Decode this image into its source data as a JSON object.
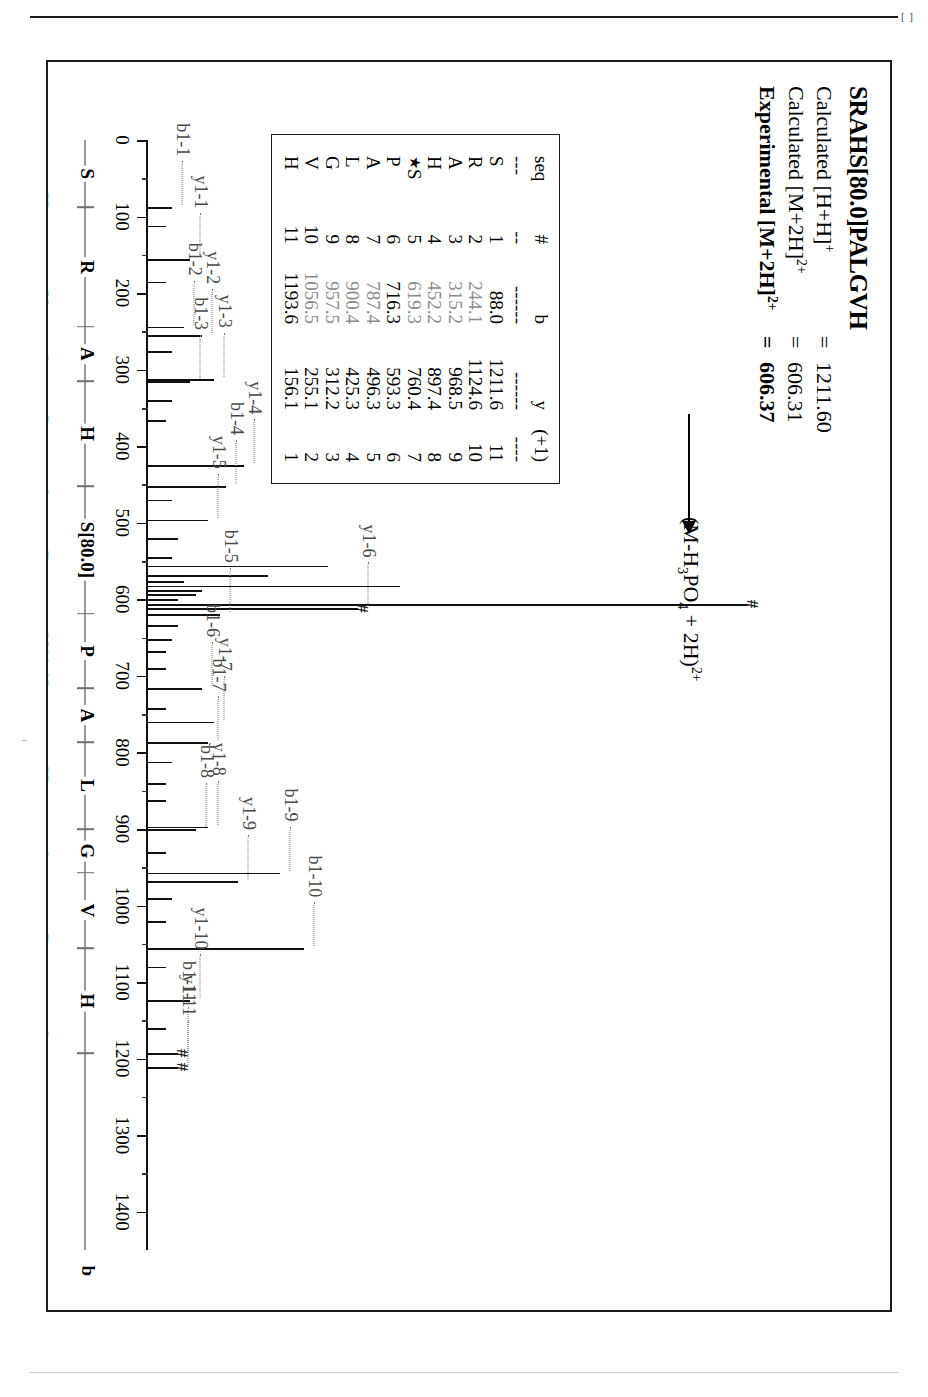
{
  "page": {
    "corner_mark": "[ ]"
  },
  "header": {
    "sequence_title": "SRAHS[80.0]PALGVH",
    "rows": [
      {
        "label_pre": "Calculated [H+H]",
        "label_sup": "+",
        "eq": "=",
        "value": "1211.60",
        "bold": false
      },
      {
        "label_pre": "Calculated [M+2H]",
        "label_sup": "2+",
        "eq": "=",
        "value": "606.31",
        "bold": false
      },
      {
        "label_pre": "Experimental [M+2H]",
        "label_sup": "2+",
        "eq": "=",
        "value": "606.37",
        "bold": true
      }
    ]
  },
  "annotation": {
    "neutral_loss_label_pre": "(M-H",
    "neutral_loss_sub1": "3",
    "neutral_loss_mid": "PO",
    "neutral_loss_sub2": "4",
    "neutral_loss_post": " + 2H)",
    "neutral_loss_sup": "2+"
  },
  "ion_table": {
    "columns": [
      "seq",
      "#",
      "b",
      "y",
      "(+1)"
    ],
    "dash": [
      "---",
      "--",
      "------",
      "------",
      "----"
    ],
    "rows": [
      {
        "seq": "S",
        "star": false,
        "num": "1",
        "b": "88.0",
        "y": "1211.6",
        "p": "11",
        "b_faint": false,
        "y_faint": false
      },
      {
        "seq": "R",
        "star": false,
        "num": "2",
        "b": "244.1",
        "y": "1124.6",
        "p": "10",
        "b_faint": true,
        "y_faint": false
      },
      {
        "seq": "A",
        "star": false,
        "num": "3",
        "b": "315.2",
        "y": "968.5",
        "p": "9",
        "b_faint": true,
        "y_faint": false
      },
      {
        "seq": "H",
        "star": false,
        "num": "4",
        "b": "452.2",
        "y": "897.4",
        "p": "8",
        "b_faint": true,
        "y_faint": false
      },
      {
        "seq": "S",
        "star": true,
        "num": "5",
        "b": "619.3",
        "y": "760.4",
        "p": "7",
        "b_faint": true,
        "y_faint": false
      },
      {
        "seq": "P",
        "star": false,
        "num": "6",
        "b": "716.3",
        "y": "593.3",
        "p": "6",
        "b_faint": false,
        "y_faint": false
      },
      {
        "seq": "A",
        "star": false,
        "num": "7",
        "b": "787.4",
        "y": "496.3",
        "p": "5",
        "b_faint": true,
        "y_faint": false
      },
      {
        "seq": "L",
        "star": false,
        "num": "8",
        "b": "900.4",
        "y": "425.3",
        "p": "4",
        "b_faint": true,
        "y_faint": false
      },
      {
        "seq": "G",
        "star": false,
        "num": "9",
        "b": "957.5",
        "y": "312.2",
        "p": "3",
        "b_faint": true,
        "y_faint": false
      },
      {
        "seq": "V",
        "star": false,
        "num": "10",
        "b": "1056.5",
        "y": "255.1",
        "p": "2",
        "b_faint": true,
        "y_faint": false
      },
      {
        "seq": "H",
        "star": false,
        "num": "11",
        "b": "1193.6",
        "y": "156.1",
        "p": "1",
        "b_faint": false,
        "y_faint": false
      }
    ]
  },
  "chart_data": {
    "type": "bar",
    "xlabel": "m/z",
    "ylabel": "relative intensity",
    "xlim": [
      0,
      1450
    ],
    "ylim": [
      0,
      100
    ],
    "grid": false,
    "legend": [],
    "axis_ticks": [
      0,
      100,
      200,
      300,
      400,
      500,
      600,
      700,
      800,
      900,
      1000,
      1100,
      1200,
      1300,
      1400
    ],
    "peaks": [
      {
        "mz": 88,
        "intensity": 4,
        "label": "b1-1",
        "thick": false
      },
      {
        "mz": 112,
        "intensity": 3,
        "label": "",
        "thick": false
      },
      {
        "mz": 156,
        "intensity": 7,
        "label": "y1-1",
        "thick": false
      },
      {
        "mz": 185,
        "intensity": 3,
        "label": "",
        "thick": false
      },
      {
        "mz": 244,
        "intensity": 6,
        "label": "b1-2",
        "thick": false
      },
      {
        "mz": 255,
        "intensity": 9,
        "label": "y1-2",
        "thick": false
      },
      {
        "mz": 276,
        "intensity": 4,
        "label": "",
        "thick": false
      },
      {
        "mz": 312,
        "intensity": 11,
        "label": "y1-3",
        "thick": false
      },
      {
        "mz": 315,
        "intensity": 7,
        "label": "b1-3",
        "thick": false
      },
      {
        "mz": 340,
        "intensity": 4,
        "label": "",
        "thick": false
      },
      {
        "mz": 366,
        "intensity": 3,
        "label": "",
        "thick": false
      },
      {
        "mz": 425,
        "intensity": 16,
        "label": "y1-4",
        "thick": false
      },
      {
        "mz": 452,
        "intensity": 13,
        "label": "b1-4",
        "thick": false
      },
      {
        "mz": 470,
        "intensity": 4,
        "label": "",
        "thick": false
      },
      {
        "mz": 496,
        "intensity": 10,
        "label": "y1-5",
        "thick": false
      },
      {
        "mz": 520,
        "intensity": 5,
        "label": "",
        "thick": false
      },
      {
        "mz": 545,
        "intensity": 4,
        "label": "",
        "thick": false
      },
      {
        "mz": 556,
        "intensity": 30,
        "label": "",
        "thick": false
      },
      {
        "mz": 568,
        "intensity": 20,
        "label": "",
        "thick": false
      },
      {
        "mz": 576,
        "intensity": 6,
        "label": "",
        "thick": false
      },
      {
        "mz": 582,
        "intensity": 42,
        "label": "",
        "thick": false
      },
      {
        "mz": 588,
        "intensity": 9,
        "label": "",
        "thick": false
      },
      {
        "mz": 593,
        "intensity": 8,
        "label": "",
        "thick": false
      },
      {
        "mz": 600,
        "intensity": 5,
        "label": "",
        "thick": false
      },
      {
        "mz": 606,
        "intensity": 100,
        "label": "",
        "thick": true
      },
      {
        "mz": 612,
        "intensity": 35,
        "label": "y1-6",
        "thick": false
      },
      {
        "mz": 619,
        "intensity": 12,
        "label": "b1-5",
        "thick": false
      },
      {
        "mz": 634,
        "intensity": 5,
        "label": "",
        "thick": false
      },
      {
        "mz": 652,
        "intensity": 4,
        "label": "",
        "thick": false
      },
      {
        "mz": 668,
        "intensity": 3,
        "label": "",
        "thick": false
      },
      {
        "mz": 690,
        "intensity": 3,
        "label": "",
        "thick": false
      },
      {
        "mz": 716,
        "intensity": 9,
        "label": "b1-6",
        "thick": false
      },
      {
        "mz": 742,
        "intensity": 3,
        "label": "",
        "thick": false
      },
      {
        "mz": 760,
        "intensity": 11,
        "label": "y1-7",
        "thick": false
      },
      {
        "mz": 787,
        "intensity": 10,
        "label": "b1-7",
        "thick": false
      },
      {
        "mz": 812,
        "intensity": 4,
        "label": "",
        "thick": false
      },
      {
        "mz": 840,
        "intensity": 3,
        "label": "",
        "thick": false
      },
      {
        "mz": 862,
        "intensity": 3,
        "label": "",
        "thick": false
      },
      {
        "mz": 897,
        "intensity": 10,
        "label": "y1-8",
        "thick": false
      },
      {
        "mz": 900,
        "intensity": 8,
        "label": "b1-8",
        "thick": false
      },
      {
        "mz": 930,
        "intensity": 3,
        "label": "",
        "thick": false
      },
      {
        "mz": 957,
        "intensity": 22,
        "label": "b1-9",
        "thick": false
      },
      {
        "mz": 968,
        "intensity": 15,
        "label": "y1-9",
        "thick": false
      },
      {
        "mz": 990,
        "intensity": 4,
        "label": "",
        "thick": false
      },
      {
        "mz": 1020,
        "intensity": 3,
        "label": "",
        "thick": false
      },
      {
        "mz": 1056,
        "intensity": 26,
        "label": "b1-10",
        "thick": false
      },
      {
        "mz": 1080,
        "intensity": 3,
        "label": "",
        "thick": false
      },
      {
        "mz": 1124,
        "intensity": 7,
        "label": "y1-10",
        "thick": false
      },
      {
        "mz": 1160,
        "intensity": 3,
        "label": "",
        "thick": false
      },
      {
        "mz": 1193,
        "intensity": 5,
        "label": "b1-11",
        "thick": false
      },
      {
        "mz": 1211,
        "intensity": 5,
        "label": "y1-11",
        "thick": false
      }
    ],
    "hash_markers": [
      {
        "mz": 606,
        "intensity": 100
      },
      {
        "mz": 612,
        "intensity": 35
      },
      {
        "mz": 1193,
        "intensity": 5
      },
      {
        "mz": 1211,
        "intensity": 5
      }
    ]
  },
  "ladders": {
    "b_series": {
      "endcap": "b",
      "residues": [
        "S",
        "R",
        "A",
        "H",
        "S[80.0]",
        "P",
        "A",
        "L",
        "G",
        "V",
        "H"
      ],
      "positions": [
        88,
        244,
        315,
        452,
        619,
        716,
        787,
        900,
        957,
        1056,
        1193
      ]
    },
    "y_series": {
      "endcap": "y",
      "residues": [
        "H",
        "V",
        "G",
        "L",
        "A",
        "P",
        "S[80.0]",
        "H",
        "A",
        "R",
        "S"
      ],
      "positions": [
        156,
        255,
        312,
        425,
        496,
        593,
        760,
        897,
        968,
        1124,
        1211
      ]
    }
  }
}
